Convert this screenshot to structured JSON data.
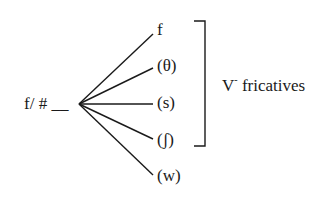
{
  "diagram": {
    "source_label": "f/ # __",
    "branches": [
      {
        "label": "f",
        "y": 32
      },
      {
        "label": "(θ)",
        "y": 67
      },
      {
        "label": "(s)",
        "y": 103
      },
      {
        "label": "(ʃ)",
        "y": 140
      },
      {
        "label": "(w)",
        "y": 175
      }
    ],
    "bracket_label_main": "V",
    "bracket_label_sup": "-",
    "bracket_label_rest": " fricatives",
    "colors": {
      "stroke": "#1a1a1a",
      "background": "#ffffff"
    }
  }
}
